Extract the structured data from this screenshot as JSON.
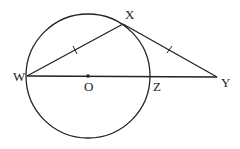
{
  "diagram": {
    "type": "geometry",
    "colors": {
      "stroke": "#222222",
      "background": "#ffffff"
    },
    "circle": {
      "center": "O",
      "cx": 88,
      "cy": 76,
      "r": 62
    },
    "points": [
      {
        "id": "W",
        "label": "W",
        "x": 27,
        "y": 76
      },
      {
        "id": "O",
        "label": "O",
        "x": 88,
        "y": 76
      },
      {
        "id": "Z",
        "label": "Z",
        "x": 151,
        "y": 76
      },
      {
        "id": "X",
        "label": "X",
        "x": 123,
        "y": 24
      },
      {
        "id": "Y",
        "label": "Y",
        "x": 217,
        "y": 77
      }
    ],
    "segments": [
      {
        "from": "W",
        "to": "Y",
        "note": "diameter WZ extended to Y"
      },
      {
        "from": "W",
        "to": "X",
        "tick_marks": 1
      },
      {
        "from": "X",
        "to": "Y",
        "tick_marks": 1
      }
    ],
    "labels": {
      "W": "W",
      "O": "O",
      "Z": "Z",
      "X": "X",
      "Y": "Y"
    }
  }
}
